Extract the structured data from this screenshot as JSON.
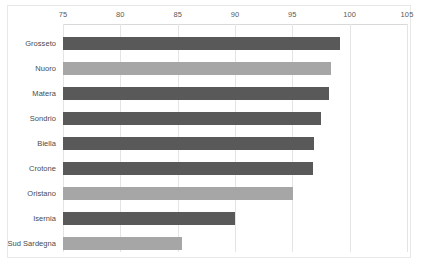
{
  "chart_data": {
    "type": "bar",
    "orientation": "horizontal",
    "title": "",
    "subtitle": "",
    "xlabel": "",
    "ylabel": "",
    "xlim": [
      75,
      105
    ],
    "xticks": [
      75,
      80,
      85,
      90,
      95,
      100,
      105
    ],
    "xtick_labels": [
      "75",
      "80",
      "85",
      "90",
      "95",
      "100",
      "105"
    ],
    "grid": true,
    "grid_axis": "x",
    "legend": false,
    "legend_position": "none",
    "axis_position": "top",
    "categories": [
      "Grosseto",
      "Nuoro",
      "Matera",
      "Sondrio",
      "Biella",
      "Crotone",
      "Oristano",
      "Isernia",
      "Sud Sardegna"
    ],
    "values": [
      99.2,
      98.4,
      98.2,
      97.5,
      96.9,
      96.8,
      95.1,
      90.0,
      85.4
    ],
    "bar_colors": [
      "#595959",
      "#a6a6a6",
      "#595959",
      "#595959",
      "#595959",
      "#595959",
      "#a6a6a6",
      "#595959",
      "#a6a6a6"
    ]
  },
  "style": {
    "dark_bar": "#595959",
    "light_bar": "#a6a6a6",
    "gridline": "#e4e4e4",
    "axis_line": "#d9d9d9",
    "frame_border": "#e8e8e8",
    "tick_text": "#5a5a5a",
    "category_text": "#4a4a4a",
    "background": "#ffffff"
  }
}
